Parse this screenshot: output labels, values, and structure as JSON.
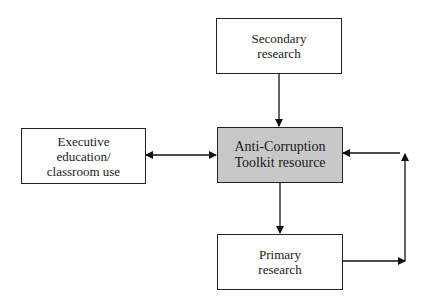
{
  "diagram": {
    "nodes": {
      "secondary": {
        "lines": [
          "Secondary",
          "research"
        ]
      },
      "center": {
        "lines": [
          "Anti-Corruption",
          "Toolkit resource"
        ],
        "fill": "#c8c8c8"
      },
      "executive": {
        "lines": [
          "Executive",
          "education/",
          "classroom use"
        ]
      },
      "primary": {
        "lines": [
          "Primary",
          "research"
        ]
      }
    },
    "edges": [
      {
        "from": "secondary",
        "to": "center",
        "type": "one-way"
      },
      {
        "from": "executive",
        "to": "center",
        "type": "two-way"
      },
      {
        "from": "center",
        "to": "primary",
        "type": "one-way"
      },
      {
        "from": "primary",
        "to": "center",
        "type": "one-way",
        "route": "loop-right"
      }
    ]
  }
}
